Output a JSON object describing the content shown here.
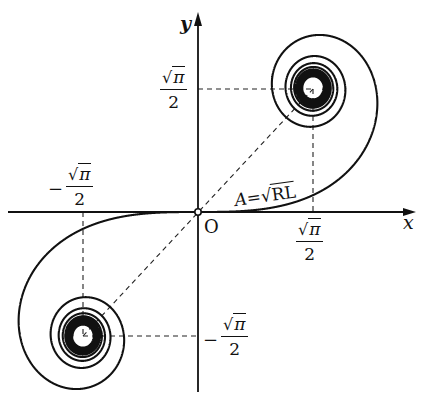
{
  "figure": {
    "origin_px": [
      198,
      212
    ],
    "scale_px_per_half_unit": {
      "x": 115,
      "y": 124
    },
    "x_axis": {
      "label": "x",
      "from_px": 8,
      "to_px": 414
    },
    "y_axis": {
      "label": "y",
      "from_px": 392,
      "to_px": 14
    },
    "origin_label": "O",
    "curve_label": {
      "lhs": "A",
      "eq": "=",
      "radical": "√",
      "radicand": "RL"
    },
    "limit_points": {
      "upper": {
        "x_label": {
          "rad": "√",
          "num": "π",
          "den": "2"
        },
        "y_label": {
          "rad": "√",
          "num": "π",
          "den": "2"
        }
      },
      "lower": {
        "x_label": {
          "sign": "−",
          "rad": "√",
          "num": "π",
          "den": "2"
        },
        "y_label": {
          "sign": "−",
          "rad": "√",
          "num": "π",
          "den": "2"
        }
      }
    },
    "colors": {
      "ink": "#111111",
      "background": "#ffffff"
    }
  }
}
